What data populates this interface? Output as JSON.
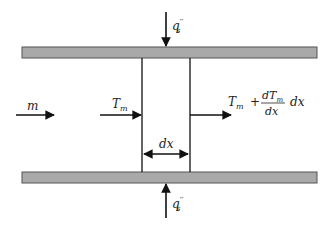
{
  "diagram": {
    "colors": {
      "wall_fill": "#a9a9a9",
      "wall_stroke": "#555555",
      "line": "#111111",
      "text": "#222222"
    },
    "labels": {
      "mass_flow": "m",
      "inlet_temp_base": "T",
      "inlet_temp_sub": "m",
      "outlet_temp_base": "T",
      "outlet_temp_sub": "m",
      "outlet_plus": "+",
      "frac_num_base": "dT",
      "frac_num_sub": "m",
      "frac_den": "dx",
      "outlet_dx": "dx",
      "element_width": "dx",
      "heat_flux_top_base": "q",
      "heat_flux_top_sup": "′′",
      "heat_flux_top_sub": "s",
      "heat_flux_bottom_base": "q",
      "heat_flux_bottom_sup": "′′",
      "heat_flux_bottom_sub": "s"
    }
  }
}
